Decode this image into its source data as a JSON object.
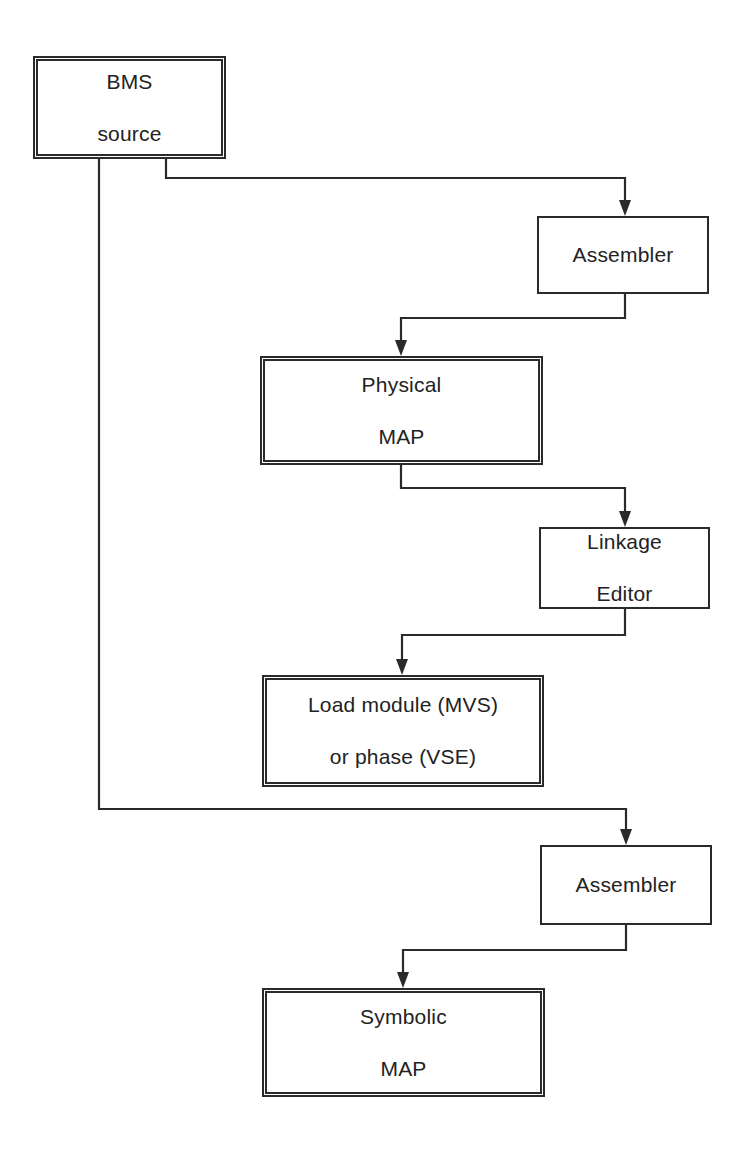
{
  "diagram": {
    "nodes": [
      {
        "id": "bms-source",
        "line1": "BMS",
        "line2": "source",
        "style": "double"
      },
      {
        "id": "assembler-1",
        "line1": "Assembler",
        "line2": "",
        "style": "single"
      },
      {
        "id": "physical-map",
        "line1": "Physical",
        "line2": "MAP",
        "style": "double"
      },
      {
        "id": "linkage-editor",
        "line1": "Linkage",
        "line2": "Editor",
        "style": "single"
      },
      {
        "id": "load-module",
        "line1": "Load module (MVS)",
        "line2": "or phase (VSE)",
        "style": "double"
      },
      {
        "id": "assembler-2",
        "line1": "Assembler",
        "line2": "",
        "style": "single"
      },
      {
        "id": "symbolic-map",
        "line1": "Symbolic",
        "line2": "MAP",
        "style": "double"
      }
    ],
    "edges": [
      {
        "from": "bms-source",
        "to": "assembler-1"
      },
      {
        "from": "assembler-1",
        "to": "physical-map"
      },
      {
        "from": "physical-map",
        "to": "linkage-editor"
      },
      {
        "from": "linkage-editor",
        "to": "load-module"
      },
      {
        "from": "bms-source",
        "to": "assembler-2"
      },
      {
        "from": "assembler-2",
        "to": "symbolic-map"
      }
    ],
    "colors": {
      "line": "#2a2a2a",
      "background": "#ffffff",
      "text": "#222222"
    }
  }
}
